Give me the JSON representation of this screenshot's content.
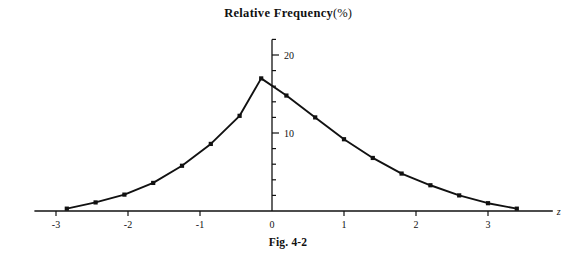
{
  "figure": {
    "title_main": "Relative Frequency",
    "title_unit": "(%)",
    "caption": "Fig. 4-2"
  },
  "chart_data": {
    "type": "line",
    "subtitle": "",
    "xlabel": "z",
    "ylabel": "",
    "xlim": [
      -3.3,
      3.9
    ],
    "ylim": [
      0,
      22
    ],
    "grid": false,
    "legend": null,
    "marker": "square",
    "line_color": "#111111",
    "marker_color": "#111111",
    "x_ticks_major": [
      -3,
      -2,
      -1,
      0,
      1,
      2,
      3
    ],
    "x_tick_labels": [
      "-3",
      "-2",
      "-1",
      "0",
      "1",
      "2",
      "3"
    ],
    "y_ticks_major": [
      10,
      20
    ],
    "y_tick_labels": [
      "10",
      "20"
    ],
    "y_ticks_minor_step": 2,
    "y_axis_top_value": 22,
    "axis_name_right": "z",
    "x": [
      -2.85,
      -2.45,
      -2.05,
      -1.65,
      -1.25,
      -0.85,
      -0.45,
      -0.15,
      0.2,
      0.6,
      1.0,
      1.4,
      1.8,
      2.2,
      2.6,
      3.0,
      3.4
    ],
    "y": [
      0.3,
      1.1,
      2.1,
      3.6,
      5.8,
      8.6,
      12.2,
      17.0,
      14.8,
      12.0,
      9.2,
      6.8,
      4.8,
      3.3,
      2.0,
      1.0,
      0.3
    ],
    "points": [
      {
        "z": -2.85,
        "freq": 0.3
      },
      {
        "z": -2.45,
        "freq": 1.1
      },
      {
        "z": -2.05,
        "freq": 2.1
      },
      {
        "z": -1.65,
        "freq": 3.6
      },
      {
        "z": -1.25,
        "freq": 5.8
      },
      {
        "z": -0.85,
        "freq": 8.6
      },
      {
        "z": -0.45,
        "freq": 12.2
      },
      {
        "z": -0.15,
        "freq": 17.0
      },
      {
        "z": 0.2,
        "freq": 14.8
      },
      {
        "z": 0.6,
        "freq": 12.0
      },
      {
        "z": 1.0,
        "freq": 9.2
      },
      {
        "z": 1.4,
        "freq": 6.8
      },
      {
        "z": 1.8,
        "freq": 4.8
      },
      {
        "z": 2.2,
        "freq": 3.3
      },
      {
        "z": 2.6,
        "freq": 2.0
      },
      {
        "z": 3.0,
        "freq": 1.0
      },
      {
        "z": 3.4,
        "freq": 0.3
      }
    ]
  }
}
